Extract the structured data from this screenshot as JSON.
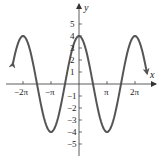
{
  "chart_data": {
    "type": "line",
    "function": "y = 4cos(x)",
    "title": "",
    "xlabel": "x",
    "ylabel": "y",
    "x_ticks": [
      "-2π",
      "-π",
      "π",
      "2π"
    ],
    "x_tick_values": [
      -6.2832,
      -3.1416,
      3.1416,
      6.2832
    ],
    "y_ticks": [
      "5",
      "4",
      "3",
      "2",
      "1",
      "-1",
      "-2",
      "-3",
      "-4",
      "-5"
    ],
    "y_tick_values": [
      5,
      4,
      3,
      2,
      1,
      -1,
      -2,
      -3,
      -4,
      -5
    ],
    "xlim": [
      -2.5,
      2.5
    ],
    "ylim": [
      -6,
      6
    ],
    "amplitude": 4,
    "period": "2π",
    "series": [
      {
        "name": "4cos(x)",
        "x": [
          -7.0,
          -6.2832,
          -4.712,
          -3.1416,
          -1.5708,
          0,
          1.5708,
          3.1416,
          4.712,
          6.2832,
          7.0
        ],
        "values": [
          3.02,
          4,
          0,
          -4,
          0,
          4,
          0,
          -4,
          0,
          4,
          3.02
        ]
      }
    ],
    "curve_color": "#555555",
    "grid": false,
    "legend": null,
    "arrows_on_curve_ends": true
  },
  "labels": {
    "x_axis": "x",
    "y_axis": "y",
    "x_ticks": [
      "−2π",
      "−π",
      "π",
      "2π"
    ],
    "y_pos": [
      "5",
      "4",
      "3",
      "2",
      "1"
    ],
    "y_neg": [
      "−1",
      "−2",
      "−3",
      "−4",
      "−5"
    ]
  }
}
